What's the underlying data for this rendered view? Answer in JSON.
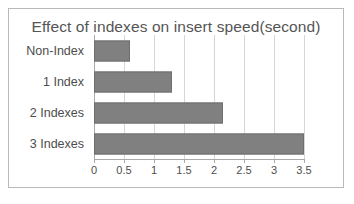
{
  "chart_data": {
    "type": "bar",
    "orientation": "horizontal",
    "title": "Effect of indexes on insert speed(second)",
    "xlabel": "",
    "ylabel": "",
    "categories": [
      "Non-Index",
      "1 Index",
      "2 Indexes",
      "3 Indexes"
    ],
    "values": [
      0.6,
      1.3,
      2.15,
      3.5
    ],
    "xlim": [
      0,
      3.5
    ],
    "xticks": [
      0,
      0.5,
      1,
      1.5,
      2,
      2.5,
      3,
      3.5
    ],
    "xtick_labels": [
      "0",
      "0.5",
      "1",
      "1.5",
      "2",
      "2.5",
      "3",
      "3.5"
    ],
    "grid": true,
    "legend": false,
    "series": [
      {
        "name": "insert speed (second)",
        "values": [
          0.6,
          1.3,
          2.15,
          3.5
        ]
      }
    ],
    "colors": {
      "bar_fill": "#808080",
      "bar_stroke": "#6f6f6f",
      "gridline": "#d6d6d6",
      "axis": "#a9a9a9",
      "title_text": "#555555",
      "label_text": "#4d4d4d",
      "frame_border": "#b9b9b9",
      "background": "#ffffff"
    }
  }
}
